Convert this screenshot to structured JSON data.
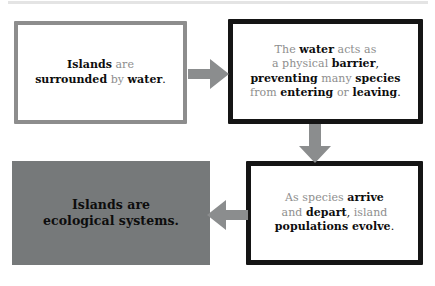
{
  "diagram": {
    "type": "flowchart",
    "title": "",
    "colors": {
      "outline_gray": "#8d8d8d",
      "outline_black": "#151515",
      "fill_gray": "#76797a",
      "arrow_gray": "#8b8d8e",
      "text_muted": "#8e8e8e",
      "text_strong": "#0d0d0d"
    },
    "nodes": [
      {
        "id": "node-islands-surrounded",
        "style": "outline-gray",
        "segments": [
          {
            "text": "Islands",
            "emphasis": "bold"
          },
          {
            "text": " are",
            "emphasis": "normal"
          },
          {
            "text": "\n",
            "emphasis": "break"
          },
          {
            "text": "surrounded",
            "emphasis": "bold"
          },
          {
            "text": " by ",
            "emphasis": "normal"
          },
          {
            "text": "water",
            "emphasis": "bold"
          },
          {
            "text": ".",
            "emphasis": "punct"
          }
        ],
        "plain_text": "Islands are surrounded by water."
      },
      {
        "id": "node-water-barrier",
        "style": "outline-black",
        "segments": [
          {
            "text": "The ",
            "emphasis": "normal"
          },
          {
            "text": "water",
            "emphasis": "bold"
          },
          {
            "text": " acts as",
            "emphasis": "normal"
          },
          {
            "text": "\n",
            "emphasis": "break"
          },
          {
            "text": "a physical ",
            "emphasis": "normal"
          },
          {
            "text": "barrier",
            "emphasis": "bold"
          },
          {
            "text": ",",
            "emphasis": "punct"
          },
          {
            "text": "\n",
            "emphasis": "break"
          },
          {
            "text": "preventing",
            "emphasis": "bold"
          },
          {
            "text": " many ",
            "emphasis": "normal"
          },
          {
            "text": "species",
            "emphasis": "bold"
          },
          {
            "text": "\n",
            "emphasis": "break"
          },
          {
            "text": "from ",
            "emphasis": "normal"
          },
          {
            "text": "entering",
            "emphasis": "bold"
          },
          {
            "text": " or ",
            "emphasis": "normal"
          },
          {
            "text": "leaving",
            "emphasis": "bold"
          },
          {
            "text": ".",
            "emphasis": "punct"
          }
        ],
        "plain_text": "The water acts as a physical barrier, preventing many species from entering or leaving."
      },
      {
        "id": "node-populations-evolve",
        "style": "outline-black",
        "segments": [
          {
            "text": "As species ",
            "emphasis": "normal"
          },
          {
            "text": "arrive",
            "emphasis": "bold"
          },
          {
            "text": "\n",
            "emphasis": "break"
          },
          {
            "text": "and ",
            "emphasis": "normal"
          },
          {
            "text": "depart",
            "emphasis": "bold"
          },
          {
            "text": ",",
            "emphasis": "punct"
          },
          {
            "text": " island",
            "emphasis": "normal"
          },
          {
            "text": "\n",
            "emphasis": "break"
          },
          {
            "text": "populations evolve",
            "emphasis": "bold"
          },
          {
            "text": ".",
            "emphasis": "punct"
          }
        ],
        "plain_text": "As species arrive and depart, island populations evolve."
      },
      {
        "id": "node-ecological-systems",
        "style": "filled-gray",
        "segments": [
          {
            "text": "Islands are",
            "emphasis": "bold"
          },
          {
            "text": "\n",
            "emphasis": "break"
          },
          {
            "text": "ecological systems.",
            "emphasis": "bold"
          }
        ],
        "plain_text": "Islands are ecological systems."
      }
    ],
    "arrows": [
      {
        "id": "arrow-1-2",
        "from": "node-islands-surrounded",
        "to": "node-water-barrier",
        "direction": "right"
      },
      {
        "id": "arrow-2-3",
        "from": "node-water-barrier",
        "to": "node-populations-evolve",
        "direction": "down"
      },
      {
        "id": "arrow-3-4",
        "from": "node-populations-evolve",
        "to": "node-ecological-systems",
        "direction": "left"
      }
    ]
  }
}
